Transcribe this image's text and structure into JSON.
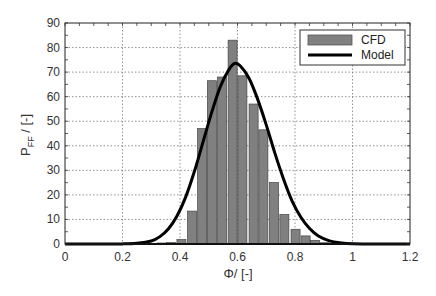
{
  "chart_data": {
    "type": "bar",
    "title": "",
    "xlabel": "Φ/ [-]",
    "ylabel_main": "P",
    "ylabel_sub": "FF",
    "ylabel_suffix": " / [-]",
    "xlim": [
      0,
      1.2
    ],
    "ylim": [
      0,
      90
    ],
    "xticks": [
      0,
      0.2,
      0.4,
      0.6,
      0.8,
      1,
      1.2
    ],
    "xtick_labels": [
      "0",
      "0.2",
      "0.4",
      "0.6",
      "0.8",
      "1",
      "1.2"
    ],
    "yticks": [
      0,
      10,
      20,
      30,
      40,
      50,
      60,
      70,
      80,
      90
    ],
    "ytick_labels": [
      "0",
      "10",
      "20",
      "30",
      "40",
      "50",
      "60",
      "70",
      "80",
      "90"
    ],
    "grid": true,
    "legend_position": "upper right",
    "bin_width": 0.0355,
    "series": [
      {
        "name": "CFD",
        "kind": "histogram",
        "color": "#808080",
        "x": [
          0.336,
          0.369,
          0.405,
          0.442,
          0.477,
          0.511,
          0.546,
          0.583,
          0.617,
          0.656,
          0.69,
          0.727,
          0.763,
          0.802,
          0.837,
          0.87,
          0.904
        ],
        "values": [
          0.4,
          0.6,
          1.8,
          13.4,
          47,
          66.5,
          68,
          83,
          68.5,
          57,
          46.5,
          25,
          12,
          6,
          3.3,
          1.5,
          0.5
        ]
      },
      {
        "name": "Model",
        "kind": "line",
        "color": "#000000",
        "x": [
          0,
          0.1,
          0.2,
          0.25,
          0.3,
          0.33,
          0.36,
          0.39,
          0.42,
          0.45,
          0.48,
          0.51,
          0.54,
          0.57,
          0.59,
          0.61,
          0.64,
          0.67,
          0.7,
          0.73,
          0.76,
          0.79,
          0.82,
          0.85,
          0.88,
          0.92,
          0.96,
          1.0,
          1.1,
          1.2
        ],
        "values": [
          0,
          0,
          0.05,
          0.3,
          1.2,
          3.0,
          6.2,
          11.5,
          19.2,
          29.5,
          41.5,
          53.5,
          64,
          71,
          73.5,
          72.5,
          67.5,
          59,
          48.5,
          37,
          26.5,
          17.5,
          11,
          6.4,
          3.4,
          1.3,
          0.45,
          0.12,
          0,
          0
        ]
      }
    ]
  }
}
